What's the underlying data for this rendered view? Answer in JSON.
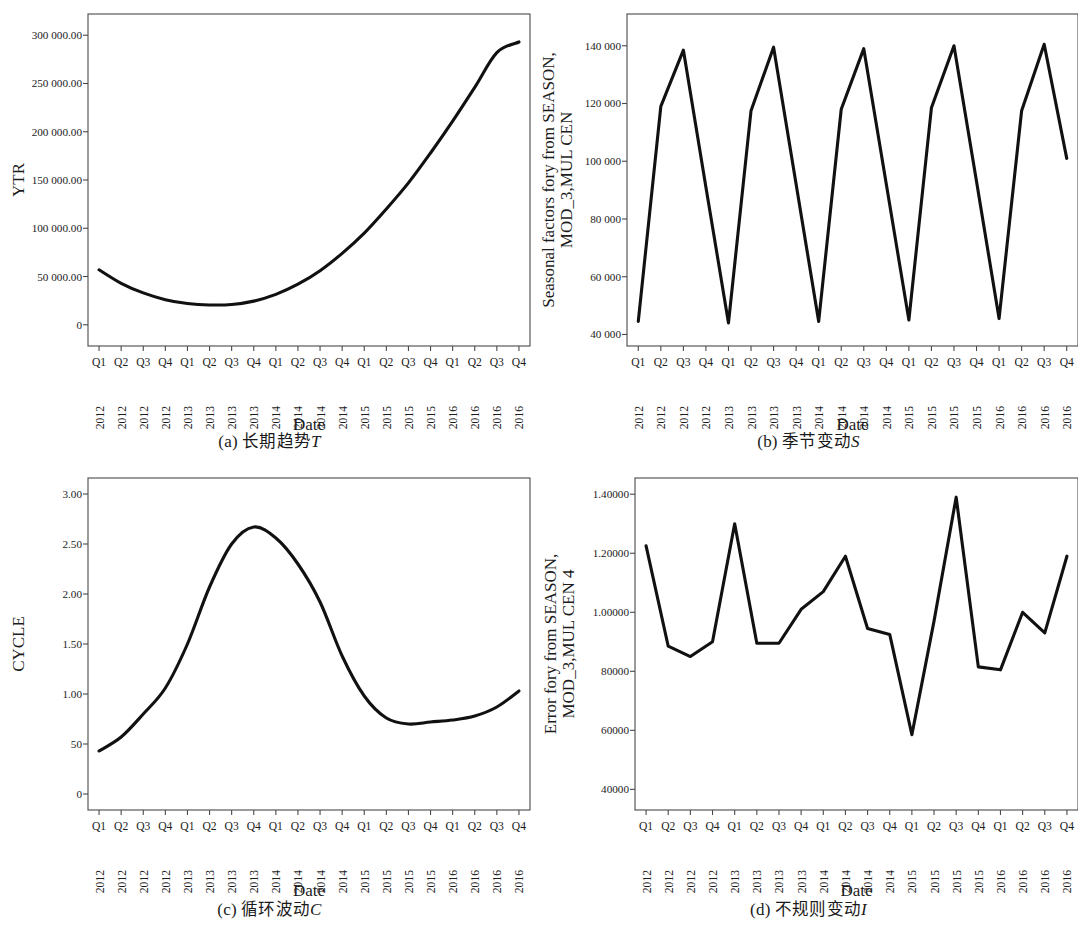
{
  "figure": {
    "panels": [
      {
        "id": "a",
        "caption_index": "(a)",
        "caption_cjk": "长期趋势",
        "caption_symbol": "T"
      },
      {
        "id": "b",
        "caption_index": "(b)",
        "caption_cjk": "季节变动",
        "caption_symbol": "S"
      },
      {
        "id": "c",
        "caption_index": "(c)",
        "caption_cjk": "循环波动",
        "caption_symbol": "C"
      },
      {
        "id": "d",
        "caption_index": "(d)",
        "caption_cjk": "不规则变动",
        "caption_symbol": "I"
      }
    ]
  },
  "shared": {
    "xlabel": "Date",
    "quarters": [
      "Q1",
      "Q2",
      "Q3",
      "Q4",
      "Q1",
      "Q2",
      "Q3",
      "Q4",
      "Q1",
      "Q2",
      "Q3",
      "Q4",
      "Q1",
      "Q2",
      "Q3",
      "Q4",
      "Q1",
      "Q2",
      "Q3",
      "Q4"
    ],
    "years": [
      "2012",
      "2012",
      "2012",
      "2012",
      "2013",
      "2013",
      "2013",
      "2013",
      "2014",
      "2014",
      "2014",
      "2014",
      "2015",
      "2015",
      "2015",
      "2015",
      "2016",
      "2016",
      "2016",
      "2016"
    ],
    "line_color": "#111111",
    "frame_color": "#4a4a4a"
  },
  "chart_data": [
    {
      "panel": "a",
      "type": "line",
      "title": "",
      "xlabel": "Date",
      "ylabel": "YTR",
      "ylabel_lines": [
        "YTR"
      ],
      "categories": [
        "Q1 2012",
        "Q2 2012",
        "Q3 2012",
        "Q4 2012",
        "Q1 2013",
        "Q2 2013",
        "Q3 2013",
        "Q4 2013",
        "Q1 2014",
        "Q2 2014",
        "Q3 2014",
        "Q4 2014",
        "Q1 2015",
        "Q2 2015",
        "Q3 2015",
        "Q4 2015",
        "Q1 2016",
        "Q2 2016",
        "Q3 2016",
        "Q4 2016"
      ],
      "ytick_labels": [
        "300 000.00",
        "250 000.00",
        "200 000.00",
        "150 000.00",
        "100 000.00",
        "50 000.00",
        "0"
      ],
      "ytick_values": [
        300000,
        250000,
        200000,
        150000,
        100000,
        50000,
        0
      ],
      "ylim": [
        -22000,
        322000
      ],
      "grid": false,
      "legend": false,
      "values": [
        57000,
        43000,
        33000,
        26000,
        22000,
        20500,
        21000,
        24500,
        31500,
        42000,
        56000,
        74000,
        95000,
        120000,
        147000,
        178000,
        211000,
        246000,
        282000,
        293000
      ]
    },
    {
      "panel": "b",
      "type": "line",
      "title": "",
      "xlabel": "Date",
      "ylabel": "Seasonal factors fory from SEASON, MOD_3,MUL CEN",
      "ylabel_lines": [
        "Seasonal factors fory from SEASON,",
        "MOD_3,MUL CEN"
      ],
      "categories": [
        "Q1 2012",
        "Q2 2012",
        "Q3 2012",
        "Q4 2012",
        "Q1 2013",
        "Q2 2013",
        "Q3 2013",
        "Q4 2013",
        "Q1 2014",
        "Q2 2014",
        "Q3 2014",
        "Q4 2014",
        "Q1 2015",
        "Q2 2015",
        "Q3 2015",
        "Q4 2015",
        "Q1 2016",
        "Q2 2016",
        "Q3 2016",
        "Q4 2016"
      ],
      "ytick_labels": [
        "140 000",
        "120 000",
        "100 000",
        "80 000",
        "60 000",
        "40 000"
      ],
      "ytick_values": [
        140000,
        120000,
        100000,
        80000,
        60000,
        40000
      ],
      "ylim": [
        36000,
        151000
      ],
      "grid": false,
      "legend": false,
      "values": [
        44500,
        119000,
        138500,
        91000,
        44000,
        117500,
        139500,
        92000,
        44500,
        118000,
        139000,
        92000,
        45000,
        118500,
        140000,
        93000,
        45500,
        117500,
        140500,
        101000
      ]
    },
    {
      "panel": "c",
      "type": "line",
      "title": "",
      "xlabel": "Date",
      "ylabel": "CYCLE",
      "ylabel_lines": [
        "CYCLE"
      ],
      "categories": [
        "Q1 2012",
        "Q2 2012",
        "Q3 2012",
        "Q4 2012",
        "Q1 2013",
        "Q2 2013",
        "Q3 2013",
        "Q4 2013",
        "Q1 2014",
        "Q2 2014",
        "Q3 2014",
        "Q4 2014",
        "Q1 2015",
        "Q2 2015",
        "Q3 2015",
        "Q4 2015",
        "Q1 2016",
        "Q2 2016",
        "Q3 2016",
        "Q4 2016"
      ],
      "ytick_labels": [
        "3.00",
        "2.50",
        "2.00",
        "1.50",
        "1.00",
        "50",
        "0"
      ],
      "ytick_values": [
        3.0,
        2.5,
        2.0,
        1.5,
        1.0,
        0.5,
        0
      ],
      "ylim": [
        -0.16,
        3.16
      ],
      "grid": false,
      "legend": false,
      "values": [
        0.43,
        0.57,
        0.8,
        1.06,
        1.5,
        2.07,
        2.5,
        2.67,
        2.56,
        2.3,
        1.92,
        1.38,
        0.98,
        0.76,
        0.7,
        0.72,
        0.74,
        0.78,
        0.87,
        1.03
      ]
    },
    {
      "panel": "d",
      "type": "line",
      "title": "",
      "xlabel": "Date",
      "ylabel": "Error fory from SEASON, MOD_3,MUL CEN 4",
      "ylabel_lines": [
        "Error fory from SEASON,",
        "MOD_3,MUL CEN 4"
      ],
      "categories": [
        "Q1 2012",
        "Q2 2012",
        "Q3 2012",
        "Q4 2012",
        "Q1 2013",
        "Q2 2013",
        "Q3 2013",
        "Q4 2013",
        "Q1 2014",
        "Q2 2014",
        "Q3 2014",
        "Q4 2014",
        "Q1 2015",
        "Q2 2015",
        "Q3 2015",
        "Q4 2015",
        "Q1 2016",
        "Q2 2016",
        "Q3 2016",
        "Q4 2016"
      ],
      "ytick_labels": [
        "1.40000",
        "1.20000",
        "1.00000",
        "80000",
        "60000",
        "40000"
      ],
      "ytick_values": [
        1.4,
        1.2,
        1.0,
        0.8,
        0.6,
        0.4
      ],
      "ylim": [
        0.33,
        1.455
      ],
      "grid": false,
      "legend": false,
      "values": [
        1.225,
        0.885,
        0.85,
        0.9,
        1.3,
        0.895,
        0.895,
        1.01,
        1.07,
        1.19,
        0.945,
        0.925,
        0.585,
        0.97,
        1.39,
        0.815,
        0.805,
        1.0,
        0.93,
        1.19
      ]
    }
  ]
}
